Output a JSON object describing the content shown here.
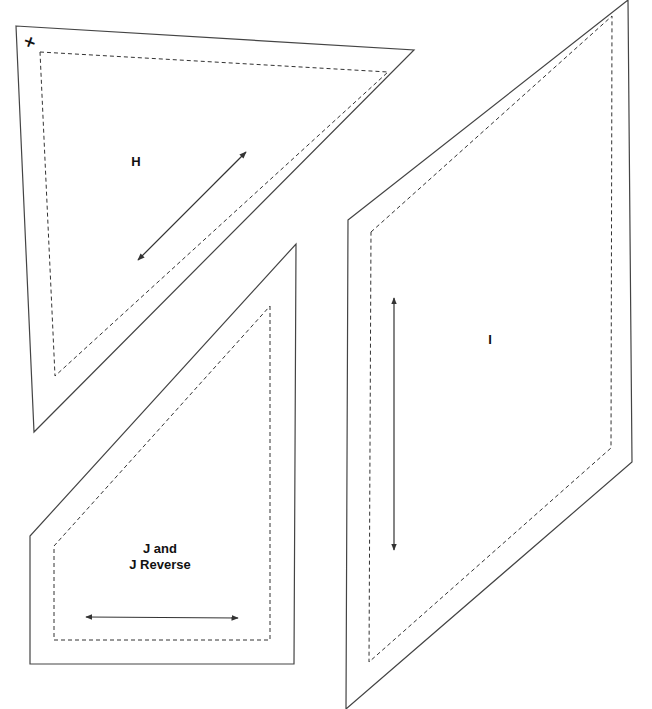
{
  "document": {
    "type": "quilt template pattern pieces",
    "colors": {
      "cut_line": "#444444",
      "sew_line": "#333333",
      "background": "#ffffff"
    }
  },
  "pieces": [
    {
      "id": "H",
      "label": "H",
      "shape": "triangle",
      "cut_line": [
        [
          16,
          26
        ],
        [
          414,
          50
        ],
        [
          34,
          432
        ]
      ],
      "sew_line": [
        [
          40,
          52
        ],
        [
          388,
          72
        ],
        [
          55,
          376
        ]
      ],
      "grainline": {
        "from": [
          138,
          260
        ],
        "to": [
          246,
          152
        ],
        "arrows": "both"
      },
      "corner_mark": "+"
    },
    {
      "id": "I",
      "label": "I",
      "shape": "parallelogram",
      "cut_line": [
        [
          348,
          220
        ],
        [
          628,
          0
        ],
        [
          632,
          462
        ],
        [
          346,
          709
        ]
      ],
      "sew_line": [
        [
          371,
          232
        ],
        [
          612,
          16
        ],
        [
          611,
          448
        ],
        [
          369,
          662
        ]
      ],
      "grainline": {
        "from": [
          394,
          298
        ],
        "to": [
          394,
          550
        ],
        "arrows": "both"
      }
    },
    {
      "id": "J",
      "label_line1": "J and",
      "label_line2": "J Reverse",
      "shape": "pentagon",
      "cut_line": [
        [
          296,
          244
        ],
        [
          294,
          664
        ],
        [
          30,
          664
        ],
        [
          30,
          536
        ],
        [
          296,
          244
        ]
      ],
      "sew_line": [
        [
          270,
          306
        ],
        [
          270,
          640
        ],
        [
          54,
          640
        ],
        [
          54,
          546
        ],
        [
          270,
          306
        ]
      ],
      "grainline": {
        "from": [
          86,
          617
        ],
        "to": [
          238,
          618
        ],
        "arrows": "both"
      }
    }
  ]
}
